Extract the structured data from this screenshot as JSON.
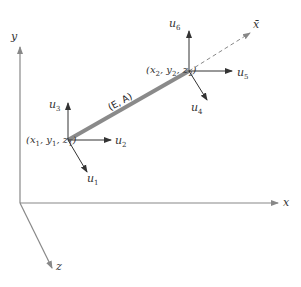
{
  "axes": {
    "x_label": "x",
    "y_label": "y",
    "z_label": "z",
    "local_axis_label": "x̄"
  },
  "element": {
    "label": "(E, A)"
  },
  "node1": {
    "coords": "(x1, y1, z1)",
    "dofs": [
      "u1",
      "u2",
      "u3"
    ]
  },
  "node2": {
    "coords": "(x2, y2, z2)",
    "dofs": [
      "u4",
      "u5",
      "u6"
    ]
  },
  "colors": {
    "axis": "#888888",
    "bar": "#8a8a8a",
    "arrow": "#333333"
  }
}
